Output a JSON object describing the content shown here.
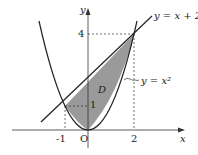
{
  "diagram": {
    "axes": {
      "x_label": "x",
      "y_label": "y",
      "origin_label": "O"
    },
    "ticks": {
      "x": [
        "-1",
        "2"
      ],
      "y": [
        "1",
        "4"
      ]
    },
    "curves": {
      "line_label": "y = x + 2",
      "parabola_label": "y = x²"
    },
    "region_label": "D",
    "colors": {
      "region_fill": "#9a9a9a",
      "stroke": "#222222"
    }
  }
}
